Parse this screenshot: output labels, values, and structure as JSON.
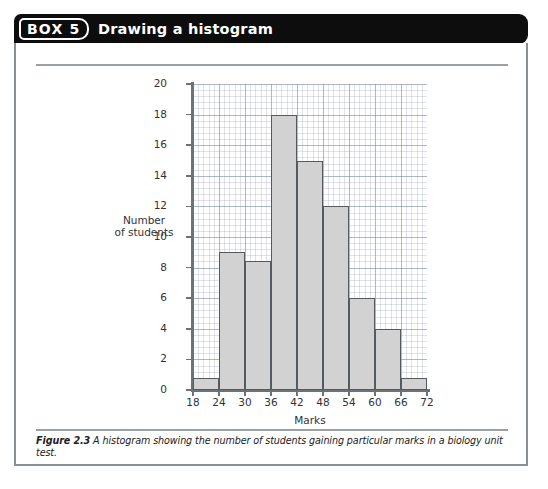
{
  "box": {
    "badge_label": "BOX 5",
    "title": "Drawing a histogram"
  },
  "figure": {
    "caption_label": "Figure 2.3",
    "caption_text": "A histogram showing the number of students gaining particular marks in a biology unit test."
  },
  "colors": {
    "header_background": "#0d0d0d",
    "header_text": "#ffffff",
    "box_border": "#8a8f96",
    "bar_fill": "#d2d2d2",
    "bar_stroke": "#555a5e",
    "grid_major": "#7882a0",
    "grid_minor": "#96a0be",
    "axis": "#6d7276"
  },
  "chart_data": {
    "type": "bar",
    "title": "",
    "xlabel": "Marks",
    "ylabel": "Number of students",
    "ylabel_line1": "Number",
    "ylabel_line2": "of students",
    "xlim": [
      18,
      72
    ],
    "ylim": [
      0,
      20
    ],
    "grid": true,
    "legend": "none",
    "bin_width": 6,
    "bin_edges": [
      18,
      24,
      30,
      36,
      42,
      48,
      54,
      60,
      66,
      72
    ],
    "categories": [
      "18-24",
      "24-30",
      "30-36",
      "36-42",
      "42-48",
      "48-54",
      "54-60",
      "60-66",
      "66-72"
    ],
    "values": [
      0.8,
      9,
      8.4,
      18,
      15,
      12,
      6,
      4,
      0.8
    ],
    "xticks": [
      18,
      24,
      30,
      36,
      42,
      48,
      54,
      60,
      66,
      72
    ],
    "xtick_labels": [
      "18",
      "24",
      "30",
      "36",
      "42",
      "48",
      "54",
      "60",
      "66",
      "72"
    ],
    "yticks": [
      0,
      2,
      4,
      6,
      8,
      10,
      12,
      14,
      16,
      18,
      20
    ],
    "ytick_labels": [
      "0",
      "2",
      "4",
      "6",
      "8",
      "10",
      "12",
      "14",
      "16",
      "18",
      "20"
    ]
  }
}
